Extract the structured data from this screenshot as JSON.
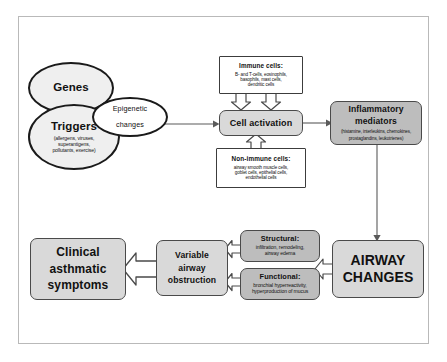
{
  "diagram": {
    "colors": {
      "frame_border": "#b9b9b9",
      "ellipse_fill": "#efefef",
      "rounded_fill": "#d9d9d9",
      "rounded_dark_fill": "#bdbdbd",
      "plain_box_fill": "#ffffff",
      "outline": "#3c3c3c",
      "arrow_outline": "#4a4a4a",
      "arrow_fill": "#ffffff",
      "text": "#111111"
    },
    "nodes": {
      "genes": {
        "label": "Genes",
        "shape": "ellipse"
      },
      "triggers": {
        "label": "Triggers",
        "detail_lines": [
          "(allergens, viruses,",
          "superantigens,",
          "pollutants, exercise)"
        ],
        "shape": "ellipse"
      },
      "epigenetic": {
        "line1": "Epigenetic",
        "line2": "changes",
        "shape": "ellipse"
      },
      "immune_cells": {
        "label": "Immune cells:",
        "detail_lines": [
          "B- and T-cells, eosinophils,",
          "basophils, mast cells,",
          "dendritic cells"
        ],
        "shape": "rectangle"
      },
      "non_immune_cells": {
        "label": "Non-immune cells:",
        "detail_lines": [
          "airway smooth muscle cells,",
          "goblet cells, epithelial cells,",
          "endothelial cells"
        ],
        "shape": "rectangle"
      },
      "cell_activation": {
        "label": "Cell activation",
        "shape": "rounded-rectangle"
      },
      "inflammatory_mediators": {
        "line1": "Inflammatory",
        "line2": "mediators",
        "detail_lines": [
          "(histamine, interleukins, chemokines,",
          "prostaglandins, leukotrienes)"
        ],
        "shape": "rounded-rectangle"
      },
      "airway_changes": {
        "line1": "AIRWAY",
        "line2": "CHANGES",
        "shape": "rounded-rectangle"
      },
      "structural": {
        "label": "Structural:",
        "detail_lines": [
          "infiltration, remodeling,",
          "airway edema"
        ],
        "shape": "rounded-rectangle"
      },
      "functional": {
        "label": "Functional:",
        "detail_lines": [
          "bronchial hyperreactivity,",
          "hyperproduction of mucus"
        ],
        "shape": "rounded-rectangle"
      },
      "variable_obstruction": {
        "line1": "Variable",
        "line2": "airway",
        "line3": "obstruction",
        "shape": "rounded-rectangle"
      },
      "clinical_symptoms": {
        "line1": "Clinical",
        "line2": "asthmatic",
        "line3": "symptoms",
        "shape": "rounded-rectangle"
      }
    },
    "connectors": [
      {
        "name": "genes-triggers-to-cell-activation",
        "from": "triggers",
        "to": "cell_activation",
        "style": "thin-line-arrow",
        "direction": "right"
      },
      {
        "name": "cell-activation-to-inflammatory-mediators",
        "from": "cell_activation",
        "to": "inflammatory_mediators",
        "style": "thin-line-arrow",
        "direction": "right"
      },
      {
        "name": "immune-cells-to-cell-activation-left",
        "from": "immune_cells",
        "to": "cell_activation",
        "style": "block-arrow",
        "direction": "down"
      },
      {
        "name": "immune-cells-to-cell-activation-right",
        "from": "immune_cells",
        "to": "cell_activation",
        "style": "block-arrow",
        "direction": "down"
      },
      {
        "name": "non-immune-cells-to-cell-activation",
        "from": "non_immune_cells",
        "to": "cell_activation",
        "style": "block-arrow",
        "direction": "up"
      },
      {
        "name": "inflammatory-mediators-to-airway-changes",
        "from": "inflammatory_mediators",
        "to": "airway_changes",
        "style": "thin-line-arrow",
        "direction": "down"
      },
      {
        "name": "airway-changes-to-structural-functional",
        "from": "airway_changes",
        "to": "structural",
        "style": "block-arrow",
        "direction": "left"
      },
      {
        "name": "structural-to-variable-obstruction",
        "from": "structural",
        "to": "variable_obstruction",
        "style": "block-arrow",
        "direction": "left"
      },
      {
        "name": "functional-to-variable-obstruction",
        "from": "functional",
        "to": "variable_obstruction",
        "style": "block-arrow",
        "direction": "left"
      },
      {
        "name": "variable-obstruction-to-clinical-symptoms",
        "from": "variable_obstruction",
        "to": "clinical_symptoms",
        "style": "block-arrow",
        "direction": "left"
      }
    ]
  }
}
